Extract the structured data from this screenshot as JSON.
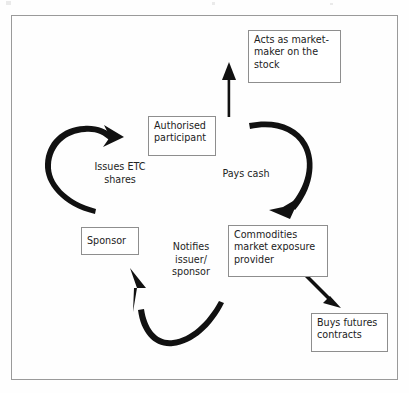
{
  "diagram": {
    "type": "cycle-flow",
    "frame_color": "#9a9a9a",
    "box_border_color": "#8e8e8e",
    "arrow_color": "#111111",
    "background": "#fefefe",
    "nodes": [
      {
        "id": "market-maker",
        "label": "Acts as market-\nmaker on the\nstock",
        "shape": "rectangle"
      },
      {
        "id": "authorised-participant",
        "label": "Authorised\nparticipant",
        "shape": "rectangle"
      },
      {
        "id": "commodities-provider",
        "label": "Commodities\nmarket exposure\nprovider",
        "shape": "rectangle"
      },
      {
        "id": "buys-futures",
        "label": "Buys futures\ncontracts",
        "shape": "rectangle"
      },
      {
        "id": "sponsor",
        "label": "Sponsor",
        "shape": "rectangle"
      }
    ],
    "edge_labels": [
      {
        "id": "issues-etc-shares",
        "label": "Issues ETC\nshares",
        "from": "sponsor",
        "to": "authorised-participant"
      },
      {
        "id": "pays-cash",
        "label": "Pays cash",
        "from": "authorised-participant",
        "to": "commodities-provider"
      },
      {
        "id": "notifies-issuer-sponsor",
        "label": "Notifies\nissuer/\nsponsor",
        "from": "commodities-provider",
        "to": "sponsor"
      }
    ],
    "arrows": [
      {
        "id": "arrow-issues-etc",
        "style": "curved",
        "direction": "up-right"
      },
      {
        "id": "arrow-pays-cash",
        "style": "curved",
        "direction": "down-left"
      },
      {
        "id": "arrow-notifies",
        "style": "curved",
        "direction": "up"
      },
      {
        "id": "arrow-to-market-maker",
        "style": "straight",
        "direction": "up"
      },
      {
        "id": "arrow-to-buys-futures",
        "style": "straight",
        "direction": "down-right"
      }
    ]
  }
}
